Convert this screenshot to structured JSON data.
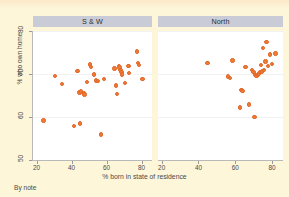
{
  "figure": {
    "background_color": "#fdf6d8",
    "panel_background_color": "#ffffff",
    "marker_color": "#ef7c34",
    "header_color": "#c9ccd6",
    "note": "By note",
    "top_strip_text": ""
  },
  "chart_data": {
    "type": "scatter",
    "title": "",
    "xlabel": "% born in state of residence",
    "ylabel": "% who own home",
    "xlim": [
      18,
      86
    ],
    "ylim": [
      50,
      80
    ],
    "xticks": [
      20,
      40,
      60,
      80
    ],
    "yticks": [
      50,
      60,
      70,
      80
    ],
    "grid": true,
    "gridlines_y": [
      60,
      70,
      80
    ],
    "legend": "none",
    "panels": [
      {
        "label": "S & W",
        "points": [
          {
            "x": 24.0,
            "y": 59.2
          },
          {
            "x": 30.5,
            "y": 69.6
          },
          {
            "x": 34.5,
            "y": 67.7
          },
          {
            "x": 41.5,
            "y": 57.9
          },
          {
            "x": 43.5,
            "y": 70.7
          },
          {
            "x": 44.5,
            "y": 65.7
          },
          {
            "x": 45.0,
            "y": 58.5
          },
          {
            "x": 45.5,
            "y": 65.9
          },
          {
            "x": 47.0,
            "y": 65.5
          },
          {
            "x": 47.5,
            "y": 65.2
          },
          {
            "x": 49.0,
            "y": 68.2
          },
          {
            "x": 50.5,
            "y": 72.2
          },
          {
            "x": 51.0,
            "y": 71.6
          },
          {
            "x": 53.0,
            "y": 69.9
          },
          {
            "x": 54.0,
            "y": 68.5
          },
          {
            "x": 55.0,
            "y": 68.4
          },
          {
            "x": 57.0,
            "y": 55.9
          },
          {
            "x": 58.5,
            "y": 68.9
          },
          {
            "x": 64.5,
            "y": 71.3
          },
          {
            "x": 65.5,
            "y": 67.3
          },
          {
            "x": 66.0,
            "y": 65.3
          },
          {
            "x": 67.0,
            "y": 71.9
          },
          {
            "x": 67.5,
            "y": 71.5
          },
          {
            "x": 68.0,
            "y": 71.0
          },
          {
            "x": 68.5,
            "y": 70.4
          },
          {
            "x": 69.0,
            "y": 69.9
          },
          {
            "x": 70.5,
            "y": 67.9
          },
          {
            "x": 72.5,
            "y": 71.8
          },
          {
            "x": 73.0,
            "y": 70.2
          },
          {
            "x": 77.5,
            "y": 75.2
          },
          {
            "x": 78.0,
            "y": 72.6
          },
          {
            "x": 78.5,
            "y": 72.1
          },
          {
            "x": 80.5,
            "y": 68.9
          }
        ]
      },
      {
        "label": "North",
        "points": [
          {
            "x": 45.0,
            "y": 72.5
          },
          {
            "x": 56.0,
            "y": 69.4
          },
          {
            "x": 57.0,
            "y": 69.1
          },
          {
            "x": 58.5,
            "y": 73.1
          },
          {
            "x": 62.5,
            "y": 62.2
          },
          {
            "x": 63.5,
            "y": 66.3
          },
          {
            "x": 64.0,
            "y": 66.0
          },
          {
            "x": 65.5,
            "y": 71.6
          },
          {
            "x": 67.5,
            "y": 62.9
          },
          {
            "x": 69.0,
            "y": 71.0
          },
          {
            "x": 70.0,
            "y": 70.4
          },
          {
            "x": 70.5,
            "y": 60.0
          },
          {
            "x": 71.0,
            "y": 69.8
          },
          {
            "x": 71.5,
            "y": 69.6
          },
          {
            "x": 72.5,
            "y": 69.8
          },
          {
            "x": 73.0,
            "y": 70.1
          },
          {
            "x": 73.5,
            "y": 70.4
          },
          {
            "x": 74.0,
            "y": 72.1
          },
          {
            "x": 74.5,
            "y": 70.6
          },
          {
            "x": 75.0,
            "y": 76.0
          },
          {
            "x": 75.5,
            "y": 71.0
          },
          {
            "x": 76.5,
            "y": 72.9
          },
          {
            "x": 77.0,
            "y": 77.5
          },
          {
            "x": 78.0,
            "y": 71.8
          },
          {
            "x": 79.0,
            "y": 74.5
          },
          {
            "x": 80.0,
            "y": 72.3
          },
          {
            "x": 82.0,
            "y": 74.8
          }
        ]
      }
    ]
  }
}
